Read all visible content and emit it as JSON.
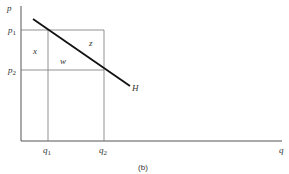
{
  "diagram": {
    "caption": "(b)",
    "axes": {
      "y_label": "p",
      "x_label": "q"
    },
    "price_ticks": [
      {
        "label": "p",
        "sub": "1"
      },
      {
        "label": "p",
        "sub": "2"
      }
    ],
    "quantity_ticks": [
      {
        "label": "q",
        "sub": "1"
      },
      {
        "label": "q",
        "sub": "2"
      }
    ],
    "regions": {
      "x": "x",
      "w": "w",
      "z": "z"
    },
    "curve_label": "H",
    "colors": {
      "axis": "#555555",
      "grid": "#777777",
      "curve": "#111111"
    }
  }
}
